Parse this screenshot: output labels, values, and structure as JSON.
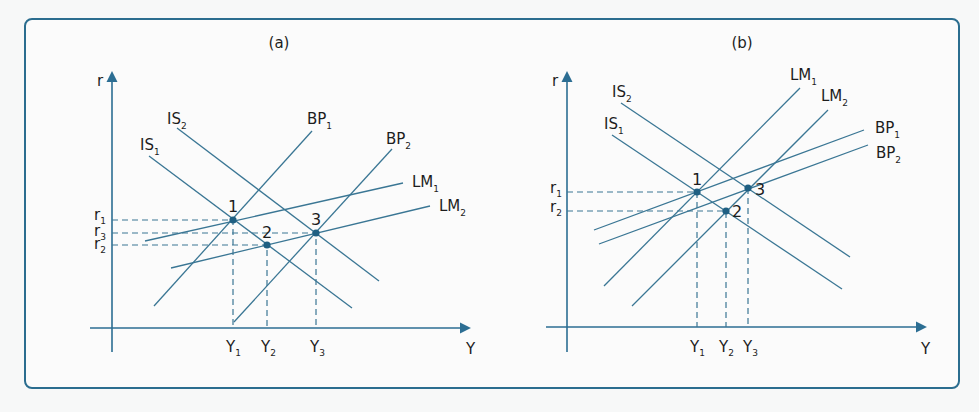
{
  "figure": {
    "border_color": "#2b6d8f",
    "line_color": "#3a7694",
    "point_color": "#1f5f82"
  },
  "panels": [
    {
      "title": "(a)",
      "axes": {
        "y_label": "r",
        "x_label": "Y"
      },
      "curves": [
        {
          "id": "IS1",
          "base": "IS",
          "sub": "1",
          "slope": "downward"
        },
        {
          "id": "IS2",
          "base": "IS",
          "sub": "2",
          "slope": "downward"
        },
        {
          "id": "BP1",
          "base": "BP",
          "sub": "1",
          "slope": "steep upward"
        },
        {
          "id": "BP2",
          "base": "BP",
          "sub": "2",
          "slope": "steep upward"
        },
        {
          "id": "LM1",
          "base": "LM",
          "sub": "1",
          "slope": "flat upward"
        },
        {
          "id": "LM2",
          "base": "LM",
          "sub": "2",
          "slope": "flat upward"
        }
      ],
      "y_ticks": [
        {
          "base": "r",
          "sub": "1"
        },
        {
          "base": "r",
          "sub": "3"
        },
        {
          "base": "r",
          "sub": "2"
        }
      ],
      "x_ticks": [
        {
          "base": "Y",
          "sub": "1"
        },
        {
          "base": "Y",
          "sub": "2"
        },
        {
          "base": "Y",
          "sub": "3"
        }
      ],
      "points": [
        {
          "label": "1",
          "at": "IS1 ∩ LM1 ∩ BP1",
          "r": "r1",
          "y": "Y1"
        },
        {
          "label": "2",
          "at": "IS1 ∩ LM2",
          "r": "r2",
          "y": "Y2"
        },
        {
          "label": "3",
          "at": "IS2 ∩ LM2 ∩ BP2",
          "r": "r3",
          "y": "Y3"
        }
      ]
    },
    {
      "title": "(b)",
      "axes": {
        "y_label": "r",
        "x_label": "Y"
      },
      "curves": [
        {
          "id": "IS1",
          "base": "IS",
          "sub": "1",
          "slope": "downward"
        },
        {
          "id": "IS2",
          "base": "IS",
          "sub": "2",
          "slope": "downward"
        },
        {
          "id": "LM1",
          "base": "LM",
          "sub": "1",
          "slope": "steep upward"
        },
        {
          "id": "LM2",
          "base": "LM",
          "sub": "2",
          "slope": "steep upward"
        },
        {
          "id": "BP1",
          "base": "BP",
          "sub": "1",
          "slope": "flat upward"
        },
        {
          "id": "BP2",
          "base": "BP",
          "sub": "2",
          "slope": "flat upward"
        }
      ],
      "y_ticks": [
        {
          "base": "r",
          "sub": "1"
        },
        {
          "base": "r",
          "sub": "2"
        }
      ],
      "x_ticks": [
        {
          "base": "Y",
          "sub": "1"
        },
        {
          "base": "Y",
          "sub": "2"
        },
        {
          "base": "Y",
          "sub": "3"
        }
      ],
      "points": [
        {
          "label": "1",
          "at": "IS1 ∩ LM1 ∩ BP1",
          "r": "r1",
          "y": "Y1"
        },
        {
          "label": "2",
          "at": "IS1 ∩ LM2",
          "r": "r2",
          "y": "Y2"
        },
        {
          "label": "3",
          "at": "IS2 ∩ LM2 ∩ BP2",
          "r": "r1",
          "y": "Y3"
        }
      ]
    }
  ]
}
